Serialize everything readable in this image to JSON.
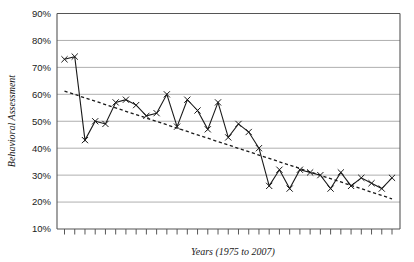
{
  "chart_data": {
    "type": "line",
    "title": "",
    "xlabel": "Years (1975 to 2007)",
    "ylabel": "Behavioral Assessment",
    "ylim": [
      10,
      90
    ],
    "ytick_labels": [
      "90%",
      "80%",
      "70%",
      "60%",
      "50%",
      "40%",
      "30%",
      "20%",
      "10%"
    ],
    "ytick_values": [
      90,
      80,
      70,
      60,
      50,
      40,
      30,
      20,
      10
    ],
    "grid": true,
    "legend": "none",
    "x": [
      1975,
      1976,
      1977,
      1978,
      1979,
      1980,
      1981,
      1982,
      1983,
      1984,
      1985,
      1986,
      1987,
      1988,
      1989,
      1990,
      1991,
      1992,
      1993,
      1994,
      1995,
      1996,
      1997,
      1998,
      1999,
      2000,
      2001,
      2002,
      2003,
      2004,
      2005,
      2006,
      2007
    ],
    "series": [
      {
        "name": "Behavioral Assessment",
        "marker": "x",
        "style": "solid",
        "values": [
          73,
          74,
          43,
          50,
          49,
          57,
          58,
          56,
          52,
          53,
          60,
          48,
          58,
          54,
          47,
          57,
          44,
          49,
          46,
          40,
          26,
          32,
          25,
          32,
          31,
          30,
          25,
          31,
          26,
          29,
          27,
          25,
          29
        ]
      },
      {
        "name": "Linear trend",
        "marker": "none",
        "style": "dotted",
        "values": [
          61.2,
          59.95,
          58.7,
          57.45,
          56.2,
          54.95,
          53.7,
          52.45,
          51.2,
          49.95,
          48.7,
          47.45,
          46.2,
          44.95,
          43.7,
          42.45,
          41.2,
          39.95,
          38.7,
          37.45,
          36.2,
          34.95,
          33.7,
          32.45,
          31.2,
          29.95,
          28.7,
          27.45,
          26.2,
          24.95,
          23.7,
          22.45,
          21.2
        ]
      }
    ]
  },
  "colors": {
    "series": "#1a1a1a",
    "trend": "#1a1a1a",
    "grid": "#9a9a9a",
    "axis": "#555555",
    "background": "#ffffff"
  }
}
